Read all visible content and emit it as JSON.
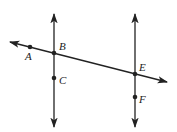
{
  "diagram": {
    "type": "geometry",
    "colors": {
      "stroke": "#222222",
      "background": "#ffffff"
    },
    "lines": [
      {
        "id": "left-vertical",
        "x1": 54,
        "y1": 14,
        "x2": 54,
        "y2": 127,
        "arrows": "both"
      },
      {
        "id": "right-vertical",
        "x1": 135,
        "y1": 14,
        "x2": 135,
        "y2": 127,
        "arrows": "both"
      },
      {
        "id": "transversal",
        "x1": 10,
        "y1": 42,
        "x2": 167,
        "y2": 82,
        "arrows": "both"
      }
    ],
    "points": [
      {
        "label": "A",
        "x": 30,
        "y": 47,
        "lx": 25,
        "ly": 60
      },
      {
        "label": "B",
        "x": 54,
        "y": 53,
        "lx": 59,
        "ly": 50
      },
      {
        "label": "C",
        "x": 54,
        "y": 78,
        "lx": 59,
        "ly": 84
      },
      {
        "label": "E",
        "x": 135,
        "y": 74,
        "lx": 139,
        "ly": 71
      },
      {
        "label": "F",
        "x": 135,
        "y": 97,
        "lx": 139,
        "ly": 103
      }
    ]
  }
}
